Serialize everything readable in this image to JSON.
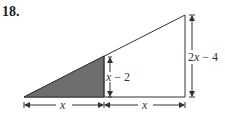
{
  "problem": {
    "number": "18.",
    "labels": {
      "base_left": "x",
      "base_right": "x",
      "small_height_var": "x",
      "small_height_rest": " − 2",
      "large_height_coef": "2",
      "large_height_var": "x",
      "large_height_rest": " − 4"
    },
    "colors": {
      "shaded": "#6e6e6e",
      "line": "#333333"
    }
  }
}
